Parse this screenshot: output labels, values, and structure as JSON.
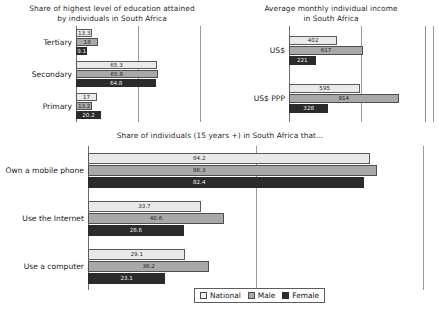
{
  "legend": {
    "items": [
      {
        "label": "National",
        "key": "national"
      },
      {
        "label": "Male",
        "key": "male"
      },
      {
        "label": "Female",
        "key": "female"
      }
    ]
  },
  "chart_data": [
    {
      "type": "bar",
      "orientation": "horizontal",
      "id": "education",
      "title": "Share of highest level of education attained by individuals in South Africa",
      "title_line1": "Share of highest level of education attained",
      "title_line2": "by individuals in South Africa",
      "xlabel": "",
      "ylabel": "",
      "categories": [
        "Tertiary",
        "Secondary",
        "Primary"
      ],
      "xlim": [
        0,
        100
      ],
      "gridlines": [
        50,
        100
      ],
      "grid": true,
      "legend_position": "bottom-shared",
      "series": [
        {
          "name": "National",
          "key": "national",
          "values": [
            13.3,
            65.3,
            17.0
          ]
        },
        {
          "name": "Male",
          "key": "male",
          "values": [
            18.0,
            65.8,
            13.2
          ]
        },
        {
          "name": "Female",
          "key": "female",
          "values": [
            9.1,
            64.8,
            20.2
          ]
        }
      ]
    },
    {
      "type": "bar",
      "orientation": "horizontal",
      "id": "income",
      "title": "Average monthly individual income in South Africa",
      "title_line1": "Average monthly individual income",
      "title_line2": "in South Africa",
      "xlabel": "",
      "ylabel": "",
      "categories": [
        "US$",
        "US$ PPP"
      ],
      "xlim": [
        0,
        1200
      ],
      "gridlines": [
        600,
        1200
      ],
      "grid": true,
      "legend_position": "bottom-shared",
      "series": [
        {
          "name": "National",
          "key": "national",
          "values": [
            402,
            595
          ]
        },
        {
          "name": "Male",
          "key": "male",
          "values": [
            617,
            914
          ]
        },
        {
          "name": "Female",
          "key": "female",
          "values": [
            221,
            328
          ]
        }
      ]
    },
    {
      "type": "bar",
      "orientation": "horizontal",
      "id": "usage",
      "title": "Share of individuals (15 years +) in South Africa that...",
      "title_line1": "Share of individuals (15 years +) in South Africa that...",
      "title_line2": "",
      "xlabel": "",
      "ylabel": "",
      "categories": [
        "Own a mobile phone",
        "Use the Internet",
        "Use a computer"
      ],
      "xlim": [
        0,
        100
      ],
      "gridlines": [
        50,
        100
      ],
      "grid": true,
      "legend_position": "bottom",
      "series": [
        {
          "name": "National",
          "key": "national",
          "values": [
            84.2,
            33.7,
            29.1
          ]
        },
        {
          "name": "Male",
          "key": "male",
          "values": [
            86.3,
            40.6,
            36.2
          ]
        },
        {
          "name": "Female",
          "key": "female",
          "values": [
            82.4,
            28.6,
            23.1
          ]
        }
      ]
    }
  ],
  "colors": {
    "national": "#e9e9e9",
    "male": "#a9a9a9",
    "female": "#2b2b2b",
    "axis": "#6f6f6f",
    "grid": "#9a9a9a",
    "background": "#ffffff"
  }
}
